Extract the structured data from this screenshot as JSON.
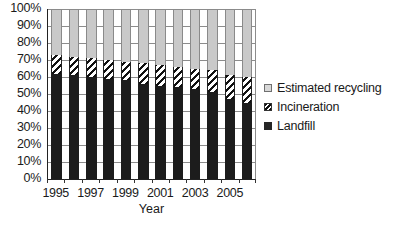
{
  "chart_data": {
    "type": "bar",
    "subtype": "stacked-percentage",
    "title": "",
    "xlabel": "Year",
    "ylabel": "",
    "ylim": [
      0,
      100
    ],
    "yunit": "%",
    "grid": true,
    "legend_position": "right",
    "x": [
      1995,
      1996,
      1997,
      1998,
      1999,
      2000,
      2001,
      2002,
      2003,
      2004,
      2005,
      2006
    ],
    "categories": [
      "1995",
      "1996",
      "1997",
      "1998",
      "1999",
      "2000",
      "2001",
      "2002",
      "2003",
      "2004",
      "2005",
      "2006"
    ],
    "xtick_labels": [
      "1995",
      "",
      "1997",
      "",
      "1999",
      "",
      "2001",
      "",
      "2003",
      "",
      "2005",
      ""
    ],
    "ytick_labels": [
      "100%",
      "90%",
      "80%",
      "70%",
      "60%",
      "50%",
      "40%",
      "30%",
      "20%",
      "10%",
      "0%"
    ],
    "ytick_values": [
      100,
      90,
      80,
      70,
      60,
      50,
      40,
      30,
      20,
      10,
      0
    ],
    "series": [
      {
        "name": "Landfill",
        "color": "#1c1c1c",
        "pattern": "solid",
        "values": [
          62,
          61,
          60,
          59,
          58,
          56,
          55,
          54,
          53,
          51,
          47,
          45
        ]
      },
      {
        "name": "Incineration",
        "color": "#111111",
        "pattern": "diagonal-stripes",
        "values": [
          11,
          11,
          11,
          11,
          11,
          12,
          12,
          12,
          12,
          13,
          14,
          15
        ]
      },
      {
        "name": "Estimated recycling",
        "color": "#c9c9c9",
        "pattern": "solid",
        "values": [
          27,
          28,
          29,
          30,
          31,
          32,
          33,
          34,
          35,
          36,
          39,
          40
        ]
      }
    ]
  },
  "legend": {
    "items": [
      {
        "label": "Estimated recycling",
        "swatch": "recycling"
      },
      {
        "label": "Incineration",
        "swatch": "incineration"
      },
      {
        "label": "Landfill",
        "swatch": "landfill"
      }
    ]
  }
}
